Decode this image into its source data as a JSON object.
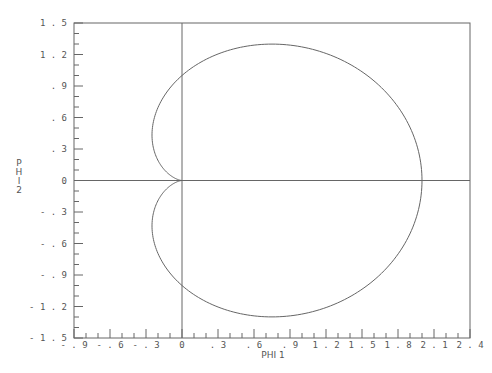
{
  "chart_data": {
    "type": "line",
    "title": "",
    "xlabel": "PHI 1",
    "ylabel": "PHI 2",
    "xlim": [
      -0.9,
      2.4
    ],
    "ylim": [
      -1.5,
      1.5
    ],
    "x_ticks": [
      "-.9",
      "-.6",
      "-.3",
      "0",
      ".3",
      ".6",
      ".9",
      "1.2",
      "1.5",
      "1.8",
      "2.1",
      "2.4"
    ],
    "y_ticks": [
      "1.5",
      "1.2",
      ".9",
      ".6",
      ".3",
      "0",
      "-.3",
      "-.6",
      "-.9",
      "-1.2",
      "-1.5"
    ],
    "grid": false,
    "reference_lines": {
      "x": 0,
      "y": 0
    },
    "series": [
      {
        "name": "cardioid",
        "description": "closed curve r = 1 + cos(theta), cusp at origin",
        "x": [
          2.0,
          1.933,
          1.75,
          1.482,
          1.183,
          0.875,
          0.75,
          0.5,
          0.25,
          0.0,
          -0.155,
          -0.25,
          -0.183,
          0.0,
          -0.183,
          -0.25,
          -0.155,
          0.0,
          0.25,
          0.5,
          0.75,
          0.875,
          1.183,
          1.482,
          1.75,
          1.933,
          2.0
        ],
        "y": [
          0.0,
          0.5,
          0.866,
          1.1,
          1.25,
          1.299,
          1.299,
          1.25,
          1.16,
          1.0,
          0.8,
          0.433,
          0.183,
          0.0,
          -0.183,
          -0.433,
          -0.8,
          -1.0,
          -1.16,
          -1.25,
          -1.299,
          -1.299,
          -1.25,
          -1.1,
          -0.866,
          -0.5,
          0.0
        ]
      }
    ]
  },
  "axes": {
    "x_title": "PHI 1",
    "y_title_letters": [
      "P",
      "H",
      "I",
      "2"
    ]
  }
}
